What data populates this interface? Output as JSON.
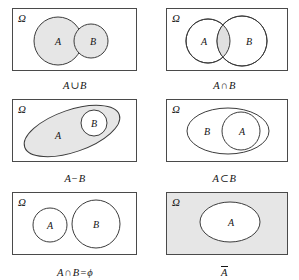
{
  "figure": {
    "universe_label": "Ω",
    "set_a_label": "A",
    "set_b_label": "B",
    "colors": {
      "shade": "#e6e6e6",
      "stroke": "#3c3c3c",
      "frame": "#4a4a4a",
      "text": "#141414",
      "background": "#ffffff"
    },
    "panels": [
      {
        "id": "union",
        "caption_parts": {
          "left": "A",
          "op": "∪",
          "right": "B"
        },
        "caption_text": "A ∪ B",
        "shaded_region": "both-circles",
        "shapes": "two overlapping circles A and B, both filled gray"
      },
      {
        "id": "intersection",
        "caption_parts": {
          "left": "A",
          "op": "∩",
          "right": "B"
        },
        "caption_text": "A ∩ B",
        "shaded_region": "lens-overlap-only",
        "shapes": "two overlapping circles A and B, only overlap filled gray"
      },
      {
        "id": "difference",
        "caption_parts": {
          "left": "A",
          "op": "−",
          "right": "B"
        },
        "caption_text": "A − B",
        "shaded_region": "ellipse-a-minus-circle-b",
        "shapes": "tilted ellipse A containing circle B; A shaded, B white"
      },
      {
        "id": "subset",
        "caption_parts": {
          "left": "A",
          "op": "⊂",
          "right": "B"
        },
        "caption_text": "A ⊂ B",
        "shaded_region": "none",
        "shapes": "ellipse B containing circle A, unshaded"
      },
      {
        "id": "disjoint",
        "caption_parts": {
          "left": "A",
          "op": "∩",
          "right": "B=ϕ"
        },
        "caption_text": "A ∩ B=ϕ",
        "shaded_region": "none",
        "shapes": "two separate non-overlapping circles A and B"
      },
      {
        "id": "complement",
        "caption_parts": {
          "left": "A",
          "op": "",
          "right": ""
        },
        "caption_text": "A̅",
        "shaded_region": "universe-minus-ellipse-a",
        "shapes": "rectangle fully shaded with white ellipse A inside"
      }
    ]
  }
}
